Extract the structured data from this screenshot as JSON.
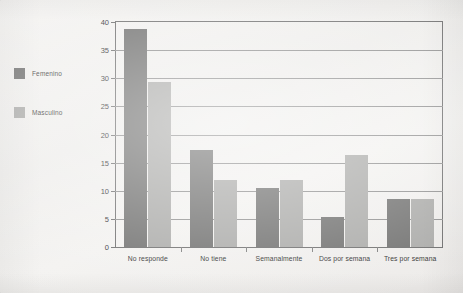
{
  "legend": {
    "items": [
      {
        "label": "Femenino",
        "color": "#70706f"
      },
      {
        "label": "Masculino",
        "color": "#aaaaa8"
      }
    ]
  },
  "axis": {
    "y_ticks": [
      "0",
      "5",
      "10",
      "15",
      "20",
      "25",
      "30",
      "35",
      "40"
    ]
  },
  "chart_data": {
    "type": "bar",
    "title": "",
    "subtitle": "",
    "xlabel": "",
    "ylabel": "",
    "categories": [
      "No responde",
      "No tiene",
      "Semanalmente",
      "Dos por semana",
      "Tres por semana"
    ],
    "series": [
      {
        "name": "Femenino",
        "color": "#70706f",
        "values": [
          38.7,
          17.3,
          10.5,
          5.4,
          8.5
        ]
      },
      {
        "name": "Masculino",
        "color": "#aaaaa8",
        "values": [
          29.4,
          12.0,
          12.0,
          16.3,
          8.5
        ]
      }
    ],
    "ylim": [
      0,
      40
    ],
    "ytick_step": 5,
    "ytick_values": [
      0,
      5,
      10,
      15,
      20,
      25,
      30,
      35,
      40
    ],
    "grid": "horizontal",
    "legend_position": "left-outside",
    "orientation": "vertical",
    "grouping": "grouped"
  }
}
